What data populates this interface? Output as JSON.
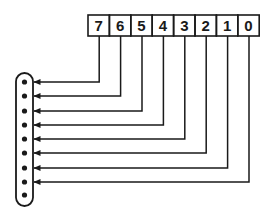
{
  "diagram": {
    "type": "register-to-connector bit mapping",
    "register": {
      "bits": [
        "7",
        "6",
        "5",
        "4",
        "3",
        "2",
        "1",
        "0"
      ],
      "x": 88,
      "y": 15,
      "cell_width": 21.4,
      "cell_height": 21
    },
    "connector": {
      "pin_count": 9,
      "x": 16,
      "y": 73,
      "width": 17,
      "height": 133,
      "pin_y": [
        82,
        96,
        111,
        125,
        139,
        153,
        168,
        182,
        195
      ]
    },
    "wires": [
      {
        "bit": "7",
        "row_y": 82
      },
      {
        "bit": "6",
        "row_y": 96
      },
      {
        "bit": "5",
        "row_y": 111
      },
      {
        "bit": "4",
        "row_y": 125
      },
      {
        "bit": "3",
        "row_y": 139
      },
      {
        "bit": "2",
        "row_y": 153
      },
      {
        "bit": "1",
        "row_y": 168
      },
      {
        "bit": "0",
        "row_y": 182
      }
    ],
    "colors": {
      "ink": "#1a1a1a",
      "background": "#ffffff"
    }
  }
}
